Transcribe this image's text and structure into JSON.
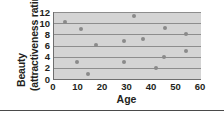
{
  "chart_data": {
    "type": "scatter",
    "title": "",
    "xlabel": "Age",
    "ylabel": "Beauty",
    "ylabel_line2": "(attractiveness rating)",
    "ylabel_full": "Beauty (attractiveness rating)",
    "xlim": [
      0,
      60
    ],
    "ylim": [
      0,
      12
    ],
    "xticks": [
      0,
      10,
      20,
      30,
      40,
      50,
      60
    ],
    "yticks": [
      0,
      2,
      4,
      6,
      8,
      10,
      12
    ],
    "xtick_labels": [
      "0",
      "10",
      "20",
      "30",
      "40",
      "50",
      "60"
    ],
    "ytick_labels": [
      "0",
      "2",
      "4",
      "6",
      "8",
      "10",
      "12"
    ],
    "grid": "horizontal",
    "gridlines_y": [
      2,
      4,
      6,
      8,
      10,
      12
    ],
    "legend": "none",
    "plot_background": "#d4d4d4",
    "marker_color": "#8a8a8a",
    "axis_color": "#6f6f6f",
    "gridline_color": "#8d8d8d",
    "text_color": "#231f20",
    "points": [
      {
        "x": 4.5,
        "y": 10.2
      },
      {
        "x": 9.5,
        "y": 3.0
      },
      {
        "x": 11.0,
        "y": 9.0
      },
      {
        "x": 14.0,
        "y": 0.9
      },
      {
        "x": 17.0,
        "y": 6.1
      },
      {
        "x": 28.5,
        "y": 6.8
      },
      {
        "x": 28.5,
        "y": 3.0
      },
      {
        "x": 32.5,
        "y": 11.3
      },
      {
        "x": 36.5,
        "y": 7.1
      },
      {
        "x": 41.5,
        "y": 2.0
      },
      {
        "x": 45.0,
        "y": 4.0
      },
      {
        "x": 45.5,
        "y": 9.2
      },
      {
        "x": 54.0,
        "y": 8.1
      },
      {
        "x": 54.0,
        "y": 5.0
      }
    ]
  }
}
